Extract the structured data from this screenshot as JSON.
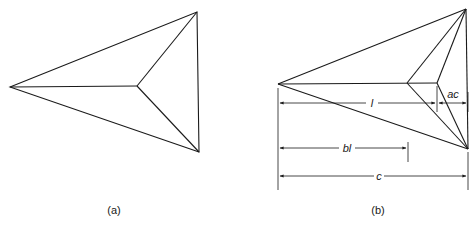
{
  "figure_a": {
    "caption": "(a)"
  },
  "figure_b": {
    "caption": "(b)",
    "dimensions": {
      "l": "l",
      "ac": "ac",
      "bl": "bl",
      "c": "c"
    }
  }
}
